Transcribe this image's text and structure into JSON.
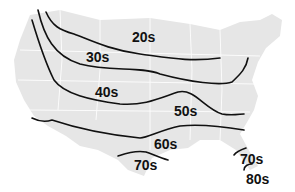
{
  "map": {
    "type": "isotherm-map",
    "region": "United States",
    "land_color": "#e6e6e6",
    "border_color": "#ffffff",
    "line_color": "#111111",
    "zones": [
      {
        "label": "20s",
        "x": 132,
        "y": 30
      },
      {
        "label": "30s",
        "x": 86,
        "y": 50
      },
      {
        "label": "40s",
        "x": 95,
        "y": 85
      },
      {
        "label": "50s",
        "x": 174,
        "y": 104
      },
      {
        "label": "60s",
        "x": 154,
        "y": 137
      },
      {
        "label": "70s",
        "x": 134,
        "y": 158
      },
      {
        "label": "70s",
        "x": 240,
        "y": 152
      },
      {
        "label": "80s",
        "x": 246,
        "y": 172
      }
    ]
  }
}
